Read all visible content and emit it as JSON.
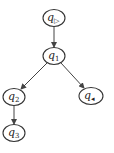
{
  "diagram": {
    "type": "tree",
    "nodes": [
      {
        "id": "q_start",
        "base": "q",
        "sub": "▷",
        "cx": 54,
        "cy": 18,
        "rx": 11,
        "ry": 8.5
      },
      {
        "id": "q1",
        "base": "q",
        "sub": "1",
        "cx": 54,
        "cy": 56,
        "rx": 11,
        "ry": 8.5
      },
      {
        "id": "q2",
        "base": "q",
        "sub": "2",
        "cx": 14,
        "cy": 97,
        "rx": 11,
        "ry": 8.5
      },
      {
        "id": "q_end",
        "base": "q",
        "sub": "◂",
        "cx": 91,
        "cy": 96,
        "rx": 12,
        "ry": 8.5
      },
      {
        "id": "q3",
        "base": "q",
        "sub": "3",
        "cx": 14,
        "cy": 133,
        "rx": 11,
        "ry": 8.5
      }
    ],
    "edges": [
      {
        "from": "q_start",
        "to": "q1"
      },
      {
        "from": "q1",
        "to": "q2"
      },
      {
        "from": "q1",
        "to": "q_end"
      },
      {
        "from": "q2",
        "to": "q3"
      }
    ],
    "colors": {
      "stroke": "#333333",
      "background": "#ffffff"
    }
  }
}
